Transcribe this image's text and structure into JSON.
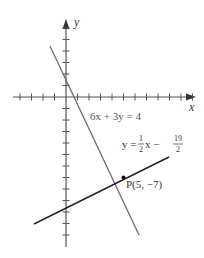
{
  "figure": {
    "type": "coordinate-plane",
    "origin_px": [
      66,
      97
    ],
    "unit_px": 11.5,
    "colors": {
      "axis": "#555555",
      "line1": "#6b6b6b",
      "line2": "#222222",
      "point": "#111111",
      "text": "#333333"
    },
    "axes": {
      "x_label": "x",
      "y_label": "y",
      "x_ticks": [
        -4,
        -3,
        -2,
        -1,
        1,
        2,
        3,
        4,
        5,
        6,
        7,
        8,
        9,
        10,
        11
      ],
      "y_ticks": [
        6,
        5,
        4,
        3,
        2,
        1,
        -1,
        -2,
        -3,
        -4,
        -5,
        -6,
        -7,
        -8,
        -9,
        -10,
        -11,
        -12
      ]
    },
    "lines": [
      {
        "name": "line-6x-3y-4",
        "equation_label": "6x + 3y = 4",
        "slope": -2,
        "intercept": 1.3333
      },
      {
        "name": "line-half-x-minus-19-over-2",
        "equation_label_prefix": "y = ",
        "frac1_num": "1",
        "frac1_den": "2",
        "equation_label_mid": "x − ",
        "frac2_num": "19",
        "frac2_den": "2",
        "slope": 0.5,
        "intercept": -9.5
      }
    ],
    "point": {
      "label": "P(5, −7)",
      "x": 5,
      "y": -7
    }
  }
}
